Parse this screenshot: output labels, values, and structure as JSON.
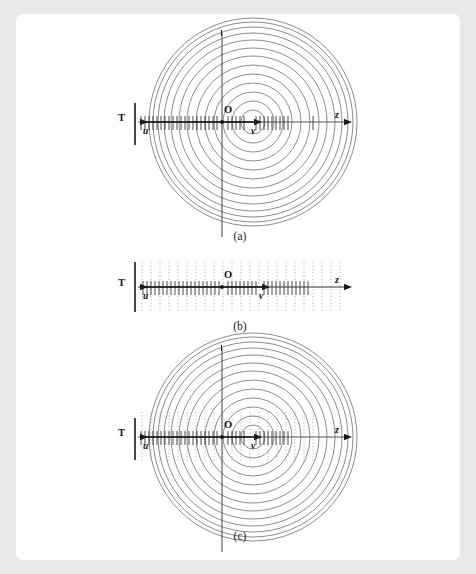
{
  "figure": {
    "background_color": "#e8e8e8",
    "plate_color": "#ffffff",
    "circle_color": "#6e6e6e",
    "axis_color": "#1a1a1a",
    "dotted_color": "#9a9a9a",
    "tick_color": "#2b2b2b"
  },
  "panels": [
    {
      "id": "panel-a",
      "caption": "(a)",
      "labels": {
        "screen": "T",
        "origin": "O",
        "z_axis": "z",
        "u_vector": "u",
        "v_vector": "v"
      },
      "content": "concentric circles with hatched axis",
      "circle_count": 13,
      "has_circles": true,
      "has_dotted_lines": false,
      "has_vertical_axis": true
    },
    {
      "id": "panel-b",
      "caption": "(b)",
      "labels": {
        "screen": "T",
        "origin": "O",
        "z_axis": "z",
        "u_vector": "u",
        "v_vector": "v"
      },
      "content": "dotted vertical planes with hatched axis",
      "dotted_line_count": 27,
      "has_circles": false,
      "has_dotted_lines": true,
      "has_vertical_axis": false
    },
    {
      "id": "panel-c",
      "caption": "(c)",
      "labels": {
        "screen": "T",
        "origin": "O",
        "z_axis": "z",
        "u_vector": "u",
        "v_vector": "v"
      },
      "content": "superposition of circles and dotted planes",
      "circle_count": 13,
      "dotted_line_count": 17,
      "has_circles": true,
      "has_dotted_lines": true,
      "has_vertical_axis": true
    }
  ]
}
